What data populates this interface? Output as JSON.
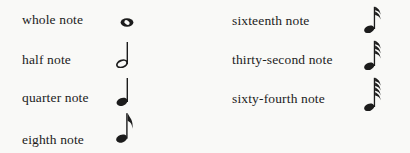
{
  "page": {
    "colors": {
      "paper": "#f9f9f7",
      "ink": "#1c1c1c"
    }
  },
  "left_column": {
    "items": [
      {
        "label": "whole note",
        "icon": "whole-note-icon"
      },
      {
        "label": "half note",
        "icon": "half-note-icon"
      },
      {
        "label": "quarter note",
        "icon": "quarter-note-icon"
      },
      {
        "label": "eighth note",
        "icon": "eighth-note-icon"
      }
    ]
  },
  "right_column": {
    "items": [
      {
        "label": "sixteenth note",
        "icon": "sixteenth-note-icon"
      },
      {
        "label": "thirty-second note",
        "icon": "thirty-second-note-icon"
      },
      {
        "label": "sixty-fourth note",
        "icon": "sixty-fourth-note-icon"
      }
    ]
  }
}
